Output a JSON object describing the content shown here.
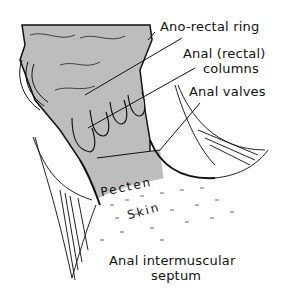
{
  "figure": {
    "colors": {
      "mucosa_fill": "#bdbdbd",
      "outline": "#111111",
      "background": "#ffffff"
    }
  },
  "labels": {
    "anorectal_ring": "Ano-rectal ring",
    "anal_columns_line1": "Anal (rectal)",
    "anal_columns_line2": "columns",
    "anal_valves": "Anal valves",
    "pecten": "Pecten",
    "skin": "Skin",
    "intermuscular_septum_line1": "Anal intermuscular",
    "intermuscular_septum_line2": "septum"
  }
}
